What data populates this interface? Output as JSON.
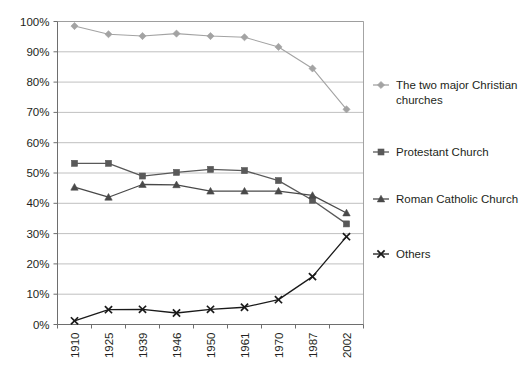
{
  "chart_data": {
    "type": "line",
    "title": "",
    "subtitle": "",
    "xlabel": "",
    "ylabel": "",
    "categories": [
      "1910",
      "1925",
      "1939",
      "1946",
      "1950",
      "1961",
      "1970",
      "1987",
      "2002"
    ],
    "ylim": [
      0,
      100
    ],
    "ytick_values": [
      0,
      10,
      20,
      30,
      40,
      50,
      60,
      70,
      80,
      90,
      100
    ],
    "ytick_labels": [
      "0%",
      "10%",
      "20%",
      "30%",
      "40%",
      "50%",
      "60%",
      "70%",
      "80%",
      "90%",
      "100%"
    ],
    "grid": true,
    "legend_position": "right",
    "series": [
      {
        "name": "The two major Christian churches",
        "marker": "diamond",
        "color": "#a3a3a3",
        "values": [
          98.5,
          95.8,
          95.2,
          96.0,
          95.2,
          94.8,
          91.6,
          84.5,
          71.0
        ]
      },
      {
        "name": "Protestant Church",
        "marker": "square",
        "color": "#595959",
        "values": [
          53.2,
          53.2,
          49.0,
          50.2,
          51.2,
          50.8,
          47.5,
          41.0,
          33.2
        ]
      },
      {
        "name": "Roman Catholic Church",
        "marker": "triangle",
        "color": "#494949",
        "values": [
          45.3,
          42.0,
          46.2,
          46.1,
          44.0,
          44.0,
          44.0,
          42.6,
          36.8
        ]
      },
      {
        "name": "Others",
        "marker": "cross",
        "color": "#1a1a1a",
        "values": [
          1.2,
          4.9,
          5.0,
          3.8,
          5.0,
          5.7,
          8.2,
          15.8,
          29.0
        ]
      }
    ]
  },
  "legend": {
    "entries": [
      {
        "label_line1": "The two major Christian",
        "label_line2": "churches"
      },
      {
        "label_line1": "Protestant Church",
        "label_line2": ""
      },
      {
        "label_line1": "Roman Catholic Church",
        "label_line2": ""
      },
      {
        "label_line1": "Others",
        "label_line2": ""
      }
    ]
  },
  "colors": {
    "background": "#ffffff",
    "gridline": "#b9b9b9",
    "frame": "#9a9a9a",
    "text": "#231f20"
  }
}
